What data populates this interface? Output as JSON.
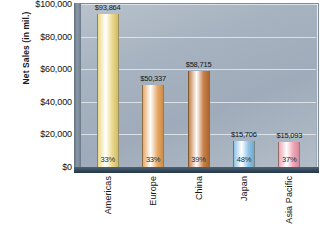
{
  "chart_data": {
    "type": "bar",
    "title": "",
    "subtitle": "",
    "xlabel": "",
    "ylabel": "Net Sales (in mil.)",
    "categories": [
      "Americas",
      "Europe",
      "China",
      "Japan",
      "Asia Pacific"
    ],
    "values": [
      93864,
      50337,
      58715,
      15706,
      15093
    ],
    "value_labels": [
      "$93,864",
      "$50,337",
      "$58,715",
      "$15,706",
      "$15,093"
    ],
    "percent_labels": [
      "33%",
      "33%",
      "39%",
      "48%",
      "37%"
    ],
    "percent_values": [
      33,
      33,
      39,
      48,
      37
    ],
    "series": [
      {
        "name": "Net Sales",
        "values": [
          93864,
          50337,
          58715,
          15706,
          15093
        ]
      }
    ],
    "bar_colors": [
      "#ead98a",
      "#e8a967",
      "#c8824a",
      "#8fc4e8",
      "#efa6b6"
    ],
    "ylim": [
      0,
      100000
    ],
    "ytick_values": [
      0,
      20000,
      40000,
      60000,
      80000,
      100000
    ],
    "ytick_labels": [
      "$0",
      "$20,000",
      "$40,000",
      "$60,000",
      "$80,000",
      "$100,000"
    ],
    "grid": true,
    "legend": false,
    "legend_position": "none",
    "plot_background": "#a7b3c0"
  },
  "colors": {
    "plot_bg": "#a7b3c0",
    "frame": "#7e8b99",
    "gridline": "#e4e9ee",
    "axis_dark": "#2b3f52",
    "text": "#111111"
  }
}
